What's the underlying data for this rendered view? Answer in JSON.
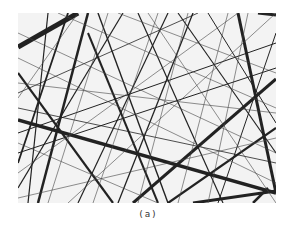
{
  "figure": {
    "caption": "(a)",
    "background_color": "#f3f3f3",
    "line_color": "#1a1a1a"
  }
}
